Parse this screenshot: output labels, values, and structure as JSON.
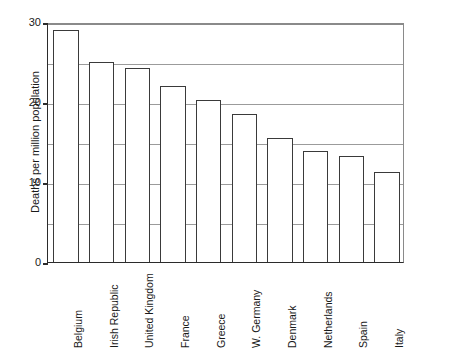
{
  "chart_data": {
    "type": "bar",
    "title": "",
    "xlabel": "",
    "ylabel": "Deaths per million population",
    "categories": [
      "Belgium",
      "Irish Republic",
      "United Kingdom",
      "France",
      "Greece",
      "W. Germany",
      "Denmark",
      "Netherlands",
      "Spain",
      "Italy"
    ],
    "values": [
      29,
      25,
      24.3,
      22,
      20.2,
      18.5,
      15.5,
      13.9,
      13.3,
      11.3
    ],
    "ylim": [
      0,
      30
    ],
    "ytick_values": [
      0,
      10,
      20,
      30
    ],
    "ytick_labels": [
      "0",
      "10",
      "20",
      "30"
    ],
    "gridline_values": [
      5,
      10,
      15,
      20,
      25,
      30
    ],
    "grid": true,
    "legend": "none",
    "bar_fill": "#ffffff",
    "bar_edge_color": "#3a3a3a",
    "grid_color": "#9b9b9b",
    "axis_color": "#2b2b2b",
    "background": "#ffffff"
  }
}
